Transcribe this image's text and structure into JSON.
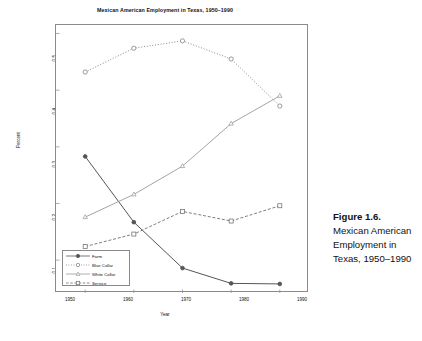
{
  "figure": {
    "title": "Mexican American Employment in Texas, 1950–1990",
    "caption_head": "Figure 1.6.",
    "caption_body": "Mexican American Employment in Texas, 1950–1990"
  },
  "chart_data": {
    "type": "line",
    "title": "Mexican American Employment in Texas, 1950–1990",
    "xlabel": "Year",
    "ylabel": "Percent",
    "x": [
      1950,
      1960,
      1970,
      1980,
      1990
    ],
    "xticks": [
      "1950",
      "1960",
      "1970",
      "1980",
      "1990"
    ],
    "yticks": [
      "0.1",
      "0.2",
      "0.3",
      "0.4",
      "0.5"
    ],
    "xlim": [
      1944,
      1996
    ],
    "ylim": [
      0.042,
      0.515
    ],
    "grid": false,
    "legend_position": "bottom-left",
    "series": [
      {
        "name": "Farm",
        "marker": "filled-circle",
        "line": "solid",
        "values": [
          0.283,
          0.167,
          0.086,
          0.059,
          0.058
        ]
      },
      {
        "name": "Blue Collar",
        "marker": "open-circle",
        "line": "dotted",
        "values": [
          0.432,
          0.474,
          0.487,
          0.455,
          0.372
        ]
      },
      {
        "name": "White Collar",
        "marker": "open-triangle",
        "line": "solid-light",
        "values": [
          0.176,
          0.216,
          0.266,
          0.341,
          0.39
        ]
      },
      {
        "name": "Service",
        "marker": "open-square",
        "line": "dashed",
        "values": [
          0.124,
          0.146,
          0.186,
          0.169,
          0.196
        ]
      }
    ]
  },
  "legend": {
    "items": [
      {
        "label": "Farm"
      },
      {
        "label": "Blue Collar"
      },
      {
        "label": "White Collar"
      },
      {
        "label": "Service"
      }
    ]
  },
  "colors": {
    "frame": "#8a8a8a",
    "farm": "#555555",
    "blue_collar": "#7b7b7b",
    "white_collar": "#9a9a9a",
    "service": "#6f6f6f",
    "text": "#111111"
  }
}
